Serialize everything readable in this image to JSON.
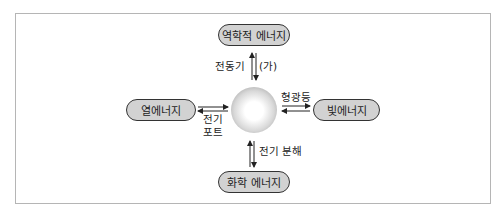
{
  "diagram": {
    "type": "energy-conversion",
    "center": {
      "shape": "sphere",
      "represents": "electrical energy (unlabeled)"
    },
    "nodes": {
      "top": "역학적 에너지",
      "left": "열에너지",
      "right": "빛에너지",
      "bottom": "화학 에너지"
    },
    "edge_labels": {
      "top_left": "전동기",
      "top_right": "(가)",
      "left_line1": "전기",
      "left_line2": "포트",
      "right": "형광등",
      "bottom": "전기 분해"
    },
    "colors": {
      "pill_fill": "#d2d2d2",
      "pill_border": "#333333",
      "frame_border": "#b5b5b5"
    }
  }
}
